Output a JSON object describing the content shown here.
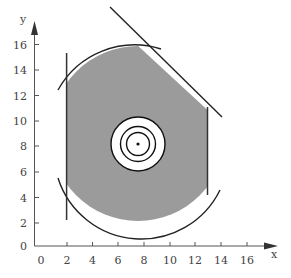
{
  "diagram": {
    "x_axis": {
      "label": "x",
      "ticks": [
        "0",
        "2",
        "4",
        "6",
        "8",
        "10",
        "12",
        "14",
        "16"
      ]
    },
    "y_axis": {
      "label": "y",
      "ticks": [
        "0",
        "2",
        "4",
        "6",
        "8",
        "10",
        "12",
        "14",
        "16"
      ]
    },
    "colors": {
      "region_fill": "#9b9b9b",
      "line": "#222222",
      "target_fill": "#ffffff",
      "axis": "#555555"
    },
    "feasible_region": {
      "description": "Shaded region bounded by circle, x=2 line, x=13 line and a diagonal line",
      "circle_center": [
        7.6,
        9.0
      ],
      "circle_radius": 6.8,
      "left_line_x": 2,
      "right_line_x": 13,
      "diagonal_line": [
        [
          5.3,
          16.8
        ],
        [
          14.1,
          8.1
        ]
      ]
    },
    "target": {
      "center": [
        7.6,
        8.2
      ],
      "rings": 3
    }
  }
}
